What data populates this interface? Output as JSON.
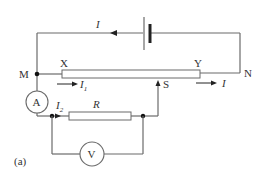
{
  "diagram": {
    "type": "circuit",
    "caption": "(a)",
    "nodes": {
      "M": "M",
      "N": "N",
      "X": "X",
      "Y": "Y",
      "S": "S"
    },
    "components": {
      "ammeter": "A",
      "voltmeter": "V",
      "resistor": "R",
      "battery": "battery"
    },
    "currents": {
      "top": "I",
      "right": "I",
      "i1": "I",
      "i1_sub": "1",
      "i2": "I",
      "i2_sub": "2"
    },
    "colors": {
      "wire": "#6b6b6b",
      "text": "#333333",
      "background": "#ffffff"
    }
  }
}
